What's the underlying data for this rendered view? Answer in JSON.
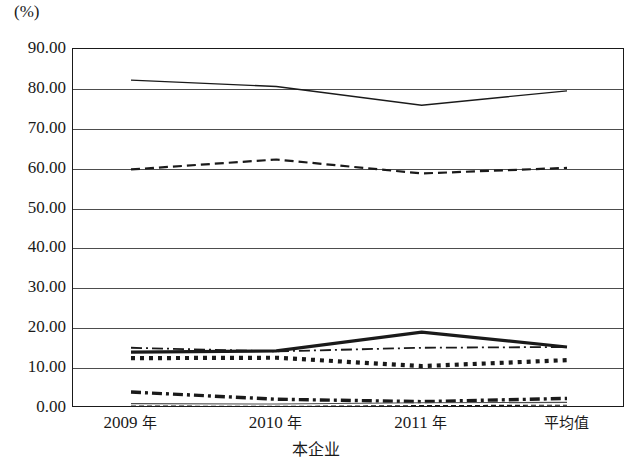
{
  "chart_data": {
    "type": "line",
    "title": "",
    "subtitle": "",
    "unit_label": "(%)",
    "xlabel": "本企业",
    "ylabel": "",
    "categories": [
      "2009 年",
      "2010 年",
      "2011 年",
      "平均值"
    ],
    "ylim": [
      0.0,
      90.0
    ],
    "ytick_labels": [
      "90.00",
      "80.00",
      "70.00",
      "60.00",
      "50.00",
      "40.00",
      "30.00",
      "20.00",
      "10.00",
      "0.00"
    ],
    "ytick_values": [
      90.0,
      80.0,
      70.0,
      60.0,
      50.0,
      40.0,
      30.0,
      20.0,
      10.0,
      0.0
    ],
    "grid": true,
    "legend": "none",
    "legend_position": "none",
    "series": [
      {
        "name": "series-1",
        "style": "thin-solid",
        "color": "#1a1a1a",
        "values": [
          82.2,
          80.6,
          75.9,
          79.5
        ]
      },
      {
        "name": "series-2",
        "style": "dashed",
        "color": "#1a1a1a",
        "values": [
          59.8,
          62.3,
          58.8,
          60.2
        ]
      },
      {
        "name": "series-3",
        "style": "thick-solid",
        "color": "#1a1a1a",
        "values": [
          14.0,
          14.3,
          19.0,
          15.3
        ]
      },
      {
        "name": "series-4",
        "style": "dash-dot",
        "color": "#1a1a1a",
        "values": [
          15.1,
          14.2,
          15.1,
          15.3
        ]
      },
      {
        "name": "series-5",
        "style": "thick-dotted",
        "color": "#1a1a1a",
        "values": [
          12.5,
          12.6,
          10.5,
          12.0
        ]
      },
      {
        "name": "series-6",
        "style": "thick-dash-dot",
        "color": "#1a1a1a",
        "values": [
          4.0,
          2.2,
          1.6,
          2.4
        ]
      },
      {
        "name": "series-7",
        "style": "thin-solid-low",
        "color": "#4d4d4d",
        "values": [
          1.1,
          1.0,
          1.3,
          1.4
        ]
      },
      {
        "name": "series-8",
        "style": "thin-dashed-low",
        "color": "#1a1a1a",
        "values": [
          0.5,
          0.4,
          0.6,
          0.7
        ]
      }
    ]
  }
}
